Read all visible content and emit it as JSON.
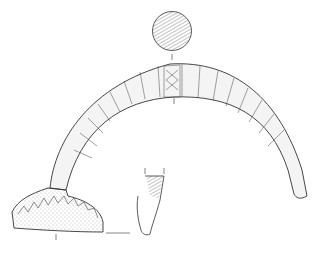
{
  "figure": {
    "background": "#ffffff",
    "ink": "#333333",
    "views": [
      "cross-section-circle",
      "side-view-bow",
      "foot-plate",
      "catch-profile"
    ]
  }
}
